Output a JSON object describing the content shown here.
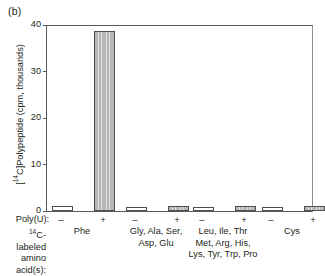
{
  "panel": {
    "label": "(b)"
  },
  "chart_data": {
    "type": "bar",
    "title": "",
    "xlabel": "",
    "ylabel": "[14C]Polypeptide (cpm, thousands)",
    "ylabel_prefix": "[",
    "ylabel_sup": "14",
    "ylabel_rest": "C]Polypeptide (cpm, thousands)",
    "ylim": [
      0,
      40
    ],
    "yticks": [
      0,
      10,
      20,
      30,
      40
    ],
    "ytick_labels": [
      "0",
      "10",
      "20",
      "30",
      "40"
    ],
    "grid": false,
    "legend": "none",
    "condition_label": "Poly(U):",
    "category_row_label_line1": "C-labeled",
    "category_row_label_sup": "14",
    "category_row_label_line2": "amino",
    "category_row_label_line3": "acid(s):",
    "categories": [
      "Phe",
      "Gly, Ala, Ser, Asp, Glu",
      "Leu, Ile, Thr Met, Arg, His, Lys, Tyr, Trp, Pro",
      "Cys"
    ],
    "category_lines": [
      [
        "Phe"
      ],
      [
        "Gly, Ala, Ser,",
        "Asp, Glu"
      ],
      [
        "Leu, Ile, Thr",
        "Met, Arg, His,",
        "Lys, Tyr, Trp, Pro"
      ],
      [
        "Cys"
      ]
    ],
    "series": [
      {
        "name": "-",
        "sign": "–",
        "fill": "white",
        "values": [
          1.0,
          0.9,
          0.8,
          0.9
        ]
      },
      {
        "name": "+",
        "sign": "+",
        "fill": "gray",
        "values": [
          38.7,
          1.0,
          1.0,
          1.0
        ]
      }
    ],
    "colors": {
      "bar_gray": "#b7b8ba",
      "bar_white": "#ffffff",
      "bar_outline": "#4d4e50",
      "axis": "#58595b"
    }
  }
}
